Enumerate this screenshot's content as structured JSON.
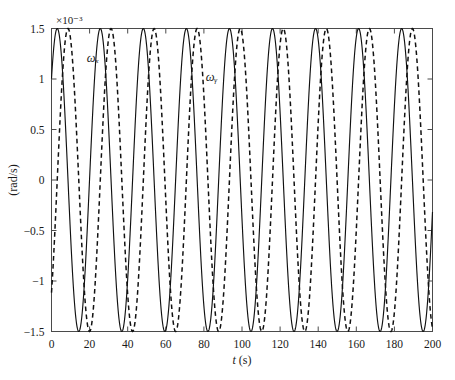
{
  "chart_data": {
    "type": "line",
    "title": "",
    "subtitle": "",
    "xlabel": "t (s)",
    "ylabel": "(rad/s)",
    "y_multiplier_text": "×10⁻³",
    "y_multiplier_value": 0.001,
    "xlim": [
      0,
      200
    ],
    "ylim": [
      -1.5,
      1.5
    ],
    "xticks": [
      0,
      20,
      40,
      60,
      80,
      100,
      120,
      140,
      160,
      180,
      200
    ],
    "xticklabels": [
      "0",
      "20",
      "40",
      "60",
      "80",
      "100",
      "120",
      "140",
      "160",
      "180",
      "200"
    ],
    "yticks": [
      1.5,
      1,
      0.5,
      0,
      -0.5,
      -1,
      -1.5
    ],
    "yticklabels": [
      "1.5",
      "1",
      "0.5",
      "0",
      "−0.5",
      "−1",
      "−1.5"
    ],
    "grid": false,
    "legend_position": "inline-annotations",
    "series": [
      {
        "name": "ωx",
        "label": "ωₓ",
        "style": "solid",
        "color": "#111111",
        "amplitude": 1.5,
        "period": 22.6,
        "phase_deg": 42,
        "annotation": {
          "text": "ωₓ",
          "x": 18.5,
          "y": 1.17
        }
      },
      {
        "name": "ωy",
        "label": "ωᵧ",
        "style": "dashed",
        "color": "#111111",
        "amplitude": 1.5,
        "period": 22.6,
        "phase_deg": -48,
        "annotation": {
          "text": "ωᵧ",
          "x": 81,
          "y": 0.98
        }
      }
    ]
  },
  "axes": {
    "exponent_label": "×10⁻³",
    "x_axis_title": "t (s)",
    "y_axis_title": "(rad/s)"
  },
  "annotations": {
    "omega_x": "ωₓ",
    "omega_y": "ωᵧ"
  },
  "colors": {
    "background": "#ffffff",
    "frame": "#4a4a4a",
    "curve": "#111111",
    "text": "#1a1a1a"
  }
}
